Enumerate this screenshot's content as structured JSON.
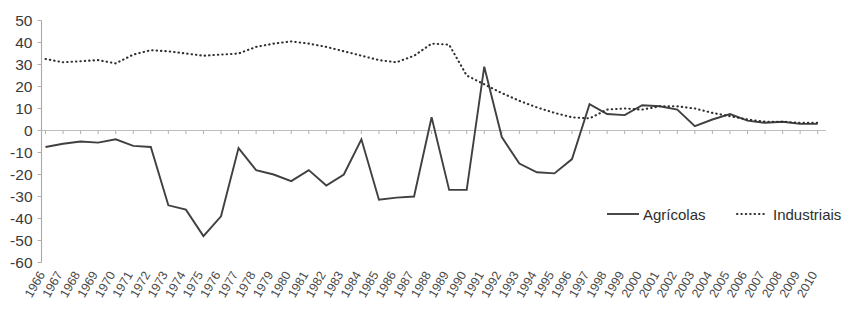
{
  "chart_data": {
    "type": "line",
    "title": "",
    "subtitle": "",
    "xlabel": "",
    "ylabel": "",
    "ylim": [
      -60,
      50
    ],
    "ytick_step": 10,
    "yticks": [
      50,
      40,
      30,
      20,
      10,
      0,
      -10,
      -20,
      -30,
      -40,
      -50,
      -60
    ],
    "grid": false,
    "zero_line": true,
    "legend_position": "bottom-right",
    "categories": [
      "1966",
      "1967",
      "1968",
      "1969",
      "1970",
      "1971",
      "1972",
      "1973",
      "1974",
      "1975",
      "1976",
      "1977",
      "1978",
      "1979",
      "1980",
      "1981",
      "1982",
      "1983",
      "1984",
      "1985",
      "1986",
      "1987",
      "1988",
      "1989",
      "1990",
      "1991",
      "1992",
      "1993",
      "1994",
      "1995",
      "1996",
      "1997",
      "1998",
      "1999",
      "2000",
      "2001",
      "2002",
      "2003",
      "2004",
      "2005",
      "2006",
      "2007",
      "2008",
      "2009",
      "2010"
    ],
    "series": [
      {
        "name": "Agrícolas",
        "style": "solid",
        "color": "#404040",
        "values": [
          -7.5,
          -6.0,
          -5.0,
          -5.5,
          -4.0,
          -7.0,
          -7.5,
          -34.0,
          -36.0,
          -48.0,
          -39.0,
          -8.0,
          -18.0,
          -20.0,
          -23.0,
          -18.0,
          -25.0,
          -20.0,
          -4.0,
          -31.5,
          -30.5,
          -30.0,
          6.0,
          -27.0,
          -27.0,
          29.0,
          -3.0,
          -15.0,
          -19.0,
          -19.5,
          -13.0,
          12.0,
          7.5,
          7.0,
          11.5,
          11.0,
          9.5,
          2.0,
          5.0,
          7.5,
          4.5,
          3.5,
          4.0,
          3.0,
          3.0
        ]
      },
      {
        "name": "Industriais",
        "style": "dotted",
        "color": "#2f2f2f",
        "values": [
          32.5,
          31.0,
          31.5,
          32.0,
          30.5,
          34.5,
          36.5,
          36.0,
          35.0,
          34.0,
          34.5,
          35.0,
          38.0,
          39.5,
          40.5,
          39.5,
          38.0,
          36.0,
          34.0,
          32.0,
          31.0,
          34.0,
          39.5,
          39.0,
          25.0,
          21.0,
          17.0,
          13.5,
          10.5,
          8.0,
          6.0,
          5.5,
          9.5,
          10.0,
          9.5,
          11.0,
          11.0,
          10.0,
          8.0,
          6.5,
          5.0,
          4.0,
          4.0,
          3.5,
          3.5
        ]
      }
    ],
    "legend": [
      {
        "label": "Agrícolas",
        "style": "solid"
      },
      {
        "label": "Industriais",
        "style": "dotted"
      }
    ]
  }
}
